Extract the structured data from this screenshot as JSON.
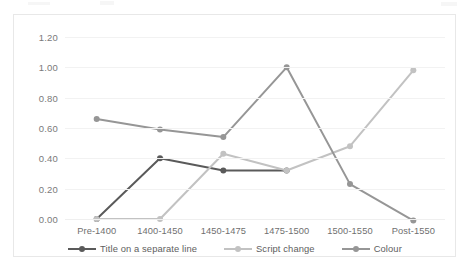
{
  "chart_data": {
    "type": "line",
    "title": "",
    "subtitle": "",
    "xlabel": "",
    "ylabel": "",
    "categories": [
      "Pre-1400",
      "1400-1450",
      "1450-1475",
      "1475-1500",
      "1500-1550",
      "Post-1550"
    ],
    "ylim": [
      0.0,
      1.2
    ],
    "ytick_labels": [
      "0.00",
      "0.20",
      "0.40",
      "0.60",
      "0.80",
      "1.00",
      "1.20"
    ],
    "ytick_values": [
      0.0,
      0.2,
      0.4,
      0.6,
      0.8,
      1.0,
      1.2
    ],
    "grid": "horizontal",
    "legend_position": "bottom",
    "series": [
      {
        "name": "Title on a separate line",
        "color": "#5a5a5a",
        "values": [
          0.0,
          0.4,
          0.32,
          0.32,
          null,
          null
        ]
      },
      {
        "name": "Script change",
        "color": "#c2c2c2",
        "values": [
          0.0,
          0.0,
          0.43,
          0.32,
          0.48,
          0.98
        ]
      },
      {
        "name": "Colour",
        "color": "#969696",
        "values": [
          0.66,
          0.59,
          0.54,
          1.0,
          0.23,
          -0.01
        ]
      }
    ]
  },
  "legend": {
    "items": [
      {
        "label": "Title on a separate line",
        "color": "#5a5a5a"
      },
      {
        "label": "Script change",
        "color": "#c2c2c2"
      },
      {
        "label": "Colour",
        "color": "#969696"
      }
    ]
  },
  "colors": {
    "background": "#ffffff",
    "border": "#e8e8e8",
    "gridline": "#f2f2f2",
    "axis_text": "#7a7a7a",
    "series_dark": "#5a5a5a",
    "series_light": "#c2c2c2",
    "series_mid": "#969696"
  }
}
